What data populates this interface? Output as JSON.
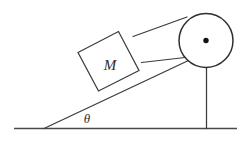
{
  "diagram": {
    "background_color": "#ffffff",
    "stroke_color": "#3c3c3c",
    "labels": {
      "mass_label": "M",
      "angle_label": "θ"
    },
    "parts": {
      "ground_name": "ground-line",
      "incline_name": "incline-surface",
      "block_name": "mass-block",
      "rope_name": "rope",
      "pulley_name": "pulley-wheel",
      "axle_name": "pulley-axle-dot",
      "post_name": "pulley-support-post"
    },
    "geometry": {
      "ground": {
        "x1": 14,
        "y1": 128.5,
        "x2": 237,
        "y2": 128.5
      },
      "incline": {
        "x1": 44,
        "y1": 128.5,
        "x2": 196,
        "y2": 57
      },
      "post": {
        "x1": 206.5,
        "y1": 68,
        "x2": 206.5,
        "y2": 128
      },
      "pulley": {
        "cx": 206,
        "cy": 40.5,
        "r": 27
      },
      "axle": {
        "cx": 206,
        "cy": 40.5,
        "r": 2.6
      },
      "block": {
        "points": "78,52.5 118.5,31.5 139,70.5 98.5,91"
      },
      "rope_upper": {
        "x1": 134,
        "y1": 37,
        "x2": 186.5,
        "y2": 17.5
      },
      "rope_lower": {
        "x1": 142,
        "y1": 63,
        "x2": 184,
        "y2": 58
      },
      "mass_text": {
        "x": 110,
        "y": 70
      },
      "theta_text": {
        "x": 87,
        "y": 123
      }
    }
  }
}
